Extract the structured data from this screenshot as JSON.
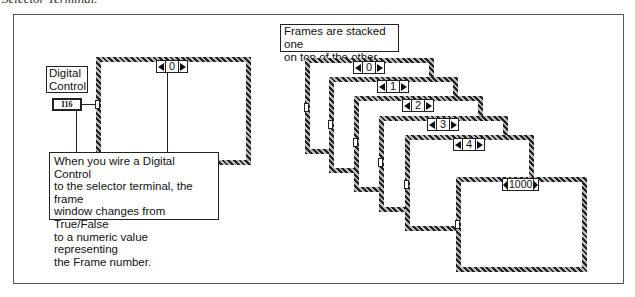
{
  "caption": "Selector Terminal.",
  "left_diagram": {
    "control_label": [
      "Digital",
      "Control"
    ],
    "control_type": "I16",
    "frame_selector_value": "0",
    "callout": [
      "When you wire a Digital Control",
      "to the selector terminal, the frame",
      "window changes from True/False",
      "to a numeric value representing",
      "the Frame number."
    ]
  },
  "right_diagram": {
    "label": [
      "Frames are stacked one",
      "on top of the other."
    ],
    "frames": [
      {
        "value": "0"
      },
      {
        "value": "1"
      },
      {
        "value": "2"
      },
      {
        "value": "3"
      },
      {
        "value": "4"
      },
      {
        "value": "1000"
      }
    ]
  }
}
